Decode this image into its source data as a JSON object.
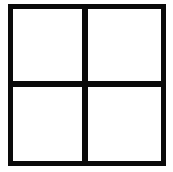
{
  "icon": {
    "name": "grid-2x2-icon",
    "description": "Square divided into four equal panes",
    "stroke_color": "#0a0a0a",
    "fill_color": "#ffffff",
    "rows": 2,
    "columns": 2,
    "panes": [
      {
        "position": "top-left"
      },
      {
        "position": "top-right"
      },
      {
        "position": "bottom-left"
      },
      {
        "position": "bottom-right"
      }
    ]
  }
}
